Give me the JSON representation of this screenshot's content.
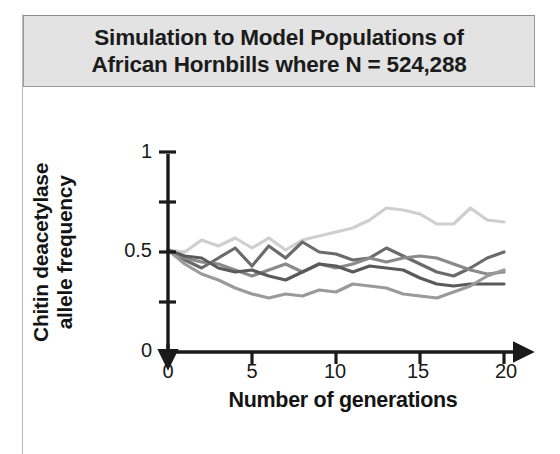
{
  "title": {
    "line1": "Simulation to Model Populations of",
    "line2": "African Hornbills where N = 524,288"
  },
  "colors": {
    "title_box_bg": "#e3e3e3",
    "title_box_border": "#9a9a9a",
    "axis": "#1a1a1a",
    "series_1": "#cfcfcf",
    "series_2": "#6b6b6b",
    "series_3": "#8a8a8a",
    "series_4": "#5a5a5a",
    "series_5": "#9a9a9a"
  },
  "axis_labels": {
    "x": "Number of generations",
    "y_line1": "Chitin deacetylase",
    "y_line2": "allele frequency"
  },
  "ticks": {
    "x": [
      "0",
      "5",
      "10",
      "15",
      "20"
    ],
    "y": [
      "0",
      "0.5",
      "1"
    ]
  },
  "chart_data": {
    "type": "line",
    "title": "Simulation to Model Populations of African Hornbills where N = 524,288",
    "xlabel": "Number of generations",
    "ylabel": "Chitin deacetylase allele frequency",
    "xlim": [
      0,
      20
    ],
    "ylim": [
      0,
      1
    ],
    "xticks": [
      0,
      5,
      10,
      15,
      20
    ],
    "yticks": [
      0,
      0.5,
      1
    ],
    "yticks_minor": [
      0.25,
      0.75
    ],
    "grid": false,
    "legend": "none",
    "x": [
      0,
      1,
      2,
      3,
      4,
      5,
      6,
      7,
      8,
      9,
      10,
      11,
      12,
      13,
      14,
      15,
      16,
      17,
      18,
      19,
      20
    ],
    "series": [
      {
        "name": "population-1",
        "color": "#cfcfcf",
        "values": [
          0.51,
          0.5,
          0.56,
          0.53,
          0.57,
          0.52,
          0.57,
          0.51,
          0.56,
          0.58,
          0.6,
          0.62,
          0.66,
          0.72,
          0.71,
          0.69,
          0.64,
          0.64,
          0.72,
          0.66,
          0.65
        ]
      },
      {
        "name": "population-2",
        "color": "#6b6b6b",
        "values": [
          0.51,
          0.46,
          0.42,
          0.47,
          0.52,
          0.43,
          0.53,
          0.47,
          0.55,
          0.5,
          0.49,
          0.46,
          0.47,
          0.52,
          0.48,
          0.44,
          0.4,
          0.38,
          0.42,
          0.47,
          0.5
        ]
      },
      {
        "name": "population-3",
        "color": "#8a8a8a",
        "values": [
          0.51,
          0.47,
          0.45,
          0.44,
          0.41,
          0.38,
          0.41,
          0.44,
          0.4,
          0.44,
          0.42,
          0.44,
          0.47,
          0.45,
          0.47,
          0.48,
          0.47,
          0.44,
          0.41,
          0.39,
          0.4
        ]
      },
      {
        "name": "population-4",
        "color": "#5a5a5a",
        "values": [
          0.51,
          0.48,
          0.47,
          0.42,
          0.4,
          0.41,
          0.38,
          0.36,
          0.4,
          0.44,
          0.43,
          0.4,
          0.43,
          0.42,
          0.41,
          0.37,
          0.34,
          0.33,
          0.34,
          0.34,
          0.34
        ]
      },
      {
        "name": "population-5",
        "color": "#9a9a9a",
        "values": [
          0.51,
          0.44,
          0.39,
          0.36,
          0.32,
          0.29,
          0.27,
          0.29,
          0.28,
          0.31,
          0.3,
          0.34,
          0.33,
          0.32,
          0.29,
          0.28,
          0.27,
          0.3,
          0.33,
          0.38,
          0.41
        ]
      }
    ]
  }
}
